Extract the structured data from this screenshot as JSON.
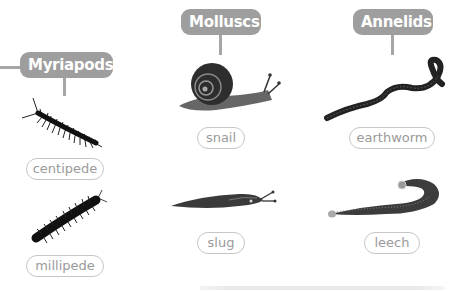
{
  "groups": [
    {
      "heading": "Myriapods",
      "animals": [
        {
          "name": "centipede",
          "icon": "centipede-icon"
        },
        {
          "name": "millipede",
          "icon": "millipede-icon"
        }
      ]
    },
    {
      "heading": "Molluscs",
      "animals": [
        {
          "name": "snail",
          "icon": "snail-icon"
        },
        {
          "name": "slug",
          "icon": "slug-icon"
        }
      ]
    },
    {
      "heading": "Annelids",
      "animals": [
        {
          "name": "earthworm",
          "icon": "earthworm-icon"
        },
        {
          "name": "leech",
          "icon": "leech-icon"
        }
      ]
    }
  ],
  "colors": {
    "heading_fill": "#9e9e9e",
    "connector": "#a6a6a6",
    "label_border": "#c6c6c6",
    "label_text": "#9a9a9a"
  }
}
